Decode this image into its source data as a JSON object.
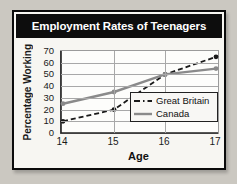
{
  "page": {
    "background": "#cbc8c1"
  },
  "chart": {
    "title": "Employment Rates of Teenagers",
    "y_axis_title": "Percentage Working",
    "x_axis_title": "Age",
    "y_ticks": [
      "70",
      "60",
      "50",
      "40",
      "30",
      "20",
      "10",
      "0"
    ],
    "x_ticks": [
      "14",
      "15",
      "16",
      "17"
    ],
    "colors": {
      "title_bar_bg": "#0d0d0d",
      "title_text": "#ffffff",
      "gridline": "#a8a8a8",
      "axis": "#222222",
      "great_britain": "#1a1a1a",
      "canada": "#8a8a8a"
    },
    "legend": [
      {
        "label": "Great Britain",
        "style": "dashed"
      },
      {
        "label": "Canada",
        "style": "solid"
      }
    ]
  },
  "chart_data": {
    "type": "line",
    "title": "Employment Rates of Teenagers",
    "xlabel": "Age",
    "ylabel": "Percentage Working",
    "x": [
      14,
      15,
      16,
      17
    ],
    "series": [
      {
        "name": "Great Britain",
        "values": [
          10,
          20,
          50,
          65
        ],
        "color": "#1a1a1a",
        "dashed": true
      },
      {
        "name": "Canada",
        "values": [
          25,
          35,
          50,
          55
        ],
        "color": "#8a8a8a",
        "dashed": false
      }
    ],
    "ylim": [
      0,
      70
    ],
    "ytick_step": 10,
    "grid": true,
    "legend_position": "inside lower right"
  }
}
